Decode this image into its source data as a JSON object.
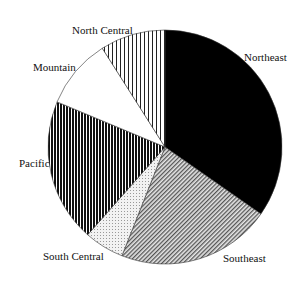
{
  "chart_data": {
    "type": "pie",
    "title": "",
    "start_angle_deg": 0,
    "direction": "clockwise",
    "categories": [
      "Northeast",
      "Southeast",
      "South Central",
      "Pacific",
      "Mountain",
      "North Central"
    ],
    "values": [
      34.7,
      21.3,
      5.5,
      19.8,
      9.7,
      9.0
    ],
    "unit": "percent (estimated from slice angles)",
    "slices": [
      {
        "label": "Northeast",
        "value": 34.7,
        "fill": "solid-black",
        "label_pos": {
          "x": 244,
          "y": 51
        }
      },
      {
        "label": "Southeast",
        "value": 21.3,
        "fill": "fine-diagonal-hatch",
        "label_pos": {
          "x": 223,
          "y": 252
        }
      },
      {
        "label": "South Central",
        "value": 5.5,
        "fill": "light-dots",
        "label_pos": {
          "x": 43,
          "y": 250
        }
      },
      {
        "label": "Pacific",
        "value": 19.8,
        "fill": "dense-vertical-stripes",
        "label_pos": {
          "x": 19,
          "y": 157
        }
      },
      {
        "label": "Mountain",
        "value": 9.7,
        "fill": "white",
        "label_pos": {
          "x": 33,
          "y": 61
        }
      },
      {
        "label": "North Central",
        "value": 9.0,
        "fill": "sparse-vertical-stripes",
        "label_pos": {
          "x": 72,
          "y": 24
        }
      }
    ],
    "legend": "none (direct labels)"
  }
}
